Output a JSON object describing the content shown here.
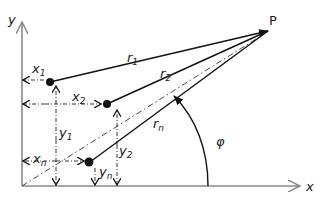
{
  "diagram": {
    "axes": {
      "x_label": "x",
      "y_label": "y",
      "axis_color": "#8a8a8a"
    },
    "target_point": {
      "label": "P"
    },
    "vectors": [
      {
        "name": "r",
        "sub": "1"
      },
      {
        "name": "r",
        "sub": "2"
      },
      {
        "name": "r",
        "sub": "n"
      }
    ],
    "coordinates": [
      {
        "name": "x",
        "sub": "1"
      },
      {
        "name": "x",
        "sub": "2"
      },
      {
        "name": "x",
        "sub": "n"
      },
      {
        "name": "y",
        "sub": "1"
      },
      {
        "name": "y",
        "sub": "2"
      },
      {
        "name": "y",
        "sub": "n"
      }
    ],
    "angle": {
      "label": "φ"
    },
    "line_color": "#111111"
  }
}
